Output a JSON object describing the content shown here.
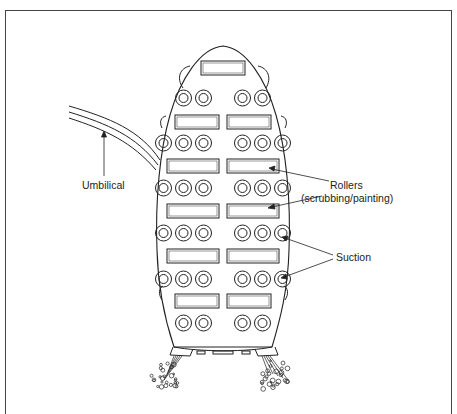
{
  "diagram": {
    "labels": {
      "umbilical": "Umbilical",
      "rollers_line1": "Rollers",
      "rollers_line2": "(scrubbing/painting)",
      "suction": "Suction"
    },
    "layout_rows": [
      {
        "type": "roller",
        "count": 1
      },
      {
        "type": "suction",
        "count": 4
      },
      {
        "type": "roller",
        "count": 2
      },
      {
        "type": "suction",
        "count": 6
      },
      {
        "type": "roller",
        "count": 2
      },
      {
        "type": "suction",
        "count": 6
      },
      {
        "type": "roller",
        "count": 2
      },
      {
        "type": "suction",
        "count": 6
      },
      {
        "type": "roller",
        "count": 2
      },
      {
        "type": "suction",
        "count": 6
      },
      {
        "type": "roller",
        "count": 2
      },
      {
        "type": "suction",
        "count": 4
      }
    ],
    "colors": {
      "line": "#222222",
      "background": "#ffffff"
    }
  }
}
